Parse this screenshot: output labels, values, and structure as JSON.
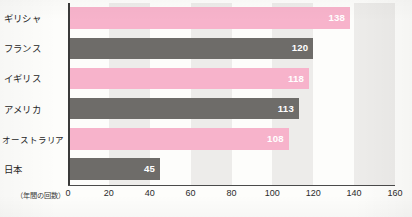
{
  "chart_data": {
    "type": "bar",
    "orientation": "horizontal",
    "title": "",
    "subtitle": "",
    "xlabel": "（年間の回数）",
    "ylabel": "",
    "categories": [
      "ギリシャ",
      "フランス",
      "イギリス",
      "アメリカ",
      "オーストラリア",
      "日本"
    ],
    "values": [
      138,
      120,
      118,
      113,
      108,
      45
    ],
    "value_labels": [
      "138",
      "120",
      "118",
      "113",
      "108",
      "45"
    ],
    "bar_colors": [
      "#f7b3cb",
      "#6e6c69",
      "#f7b3cb",
      "#6e6c69",
      "#f7b3cb",
      "#6e6c69"
    ],
    "xlim": [
      0,
      160
    ],
    "xticks": [
      0,
      20,
      40,
      60,
      80,
      100,
      120,
      140,
      160
    ],
    "xtick_labels": [
      "0",
      "20",
      "40",
      "60",
      "80",
      "100",
      "120",
      "140",
      "160"
    ],
    "grid": false,
    "banded_background": true,
    "band_color": "#edecea",
    "band_interval": 20,
    "legend": "none",
    "value_label_color": "#ffffff"
  },
  "colors": {
    "pink": "#f7b3cb",
    "gray": "#6e6c69",
    "band": "#edecea",
    "axis": "#3a3a3a",
    "text": "#262626",
    "background": "#fdfdfb"
  }
}
